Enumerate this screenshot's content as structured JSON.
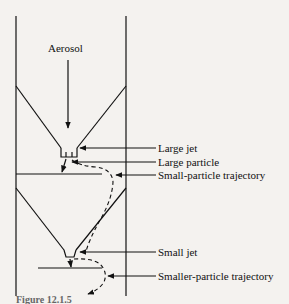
{
  "diagram": {
    "type": "cascade-impactor-schematic",
    "labels": {
      "aerosol": "Aerosol",
      "large_jet": "Large jet",
      "large_particle": "Large particle",
      "small_particle_trajectory": "Small-particle trajectory",
      "small_jet": "Small jet",
      "smaller_particle_trajectory": "Smaller-particle trajectory"
    },
    "caption": "Figure 12.1.5"
  }
}
